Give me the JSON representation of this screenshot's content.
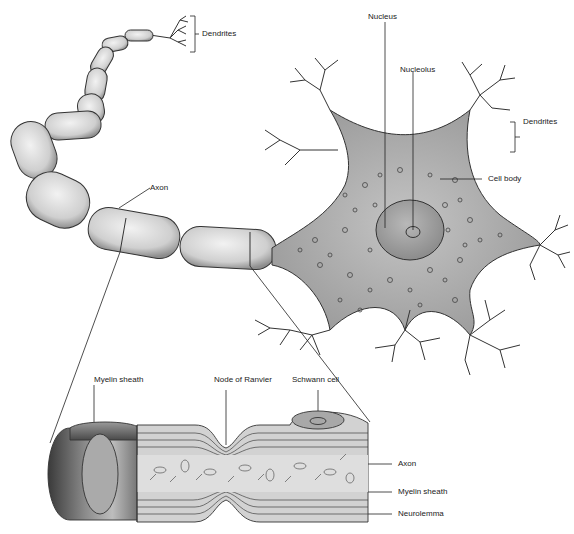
{
  "diagram": {
    "labels": {
      "dendrites_top": "Dendrites",
      "nucleus": "Nucleus",
      "nucleolus": "Nucleolus",
      "dendrites_right": "Dendrites",
      "cell_body": "Cell body",
      "axon_upper": "Axon",
      "myelin_sheath_upper": "Myelin sheath",
      "node_of_ranvier": "Node of Ranvier",
      "schwann_cell": "Schwann cell",
      "axon_detail": "Axon",
      "myelin_sheath_detail": "Myelin sheath",
      "neurolemma": "Neurolemma"
    },
    "colors": {
      "line": "#222222",
      "myelin_fill": "#d4d4d4",
      "cell_body_fill": "#a9a9a9",
      "nucleus_fill": "#9a9a9a",
      "sheath_dark": "#5a5a5a",
      "axon_core": "#d9d9d9"
    }
  }
}
